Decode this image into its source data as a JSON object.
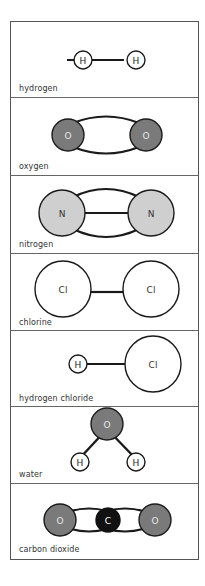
{
  "colors": {
    "border": "#555555",
    "bond": "#1a1a1a",
    "oxygen_fill": "#7a7a7a",
    "nitrogen_fill": "#cfcfcf",
    "carbon_fill": "#111111",
    "hydrogen_fill": "#ffffff",
    "chlorine_fill": "#ffffff",
    "label_text": "#333333"
  },
  "molecules": [
    {
      "name": "hydrogen",
      "atoms": [
        {
          "symbol": "H",
          "element": "hydrogen"
        },
        {
          "symbol": "H",
          "element": "hydrogen"
        }
      ],
      "bond": "single"
    },
    {
      "name": "oxygen",
      "atoms": [
        {
          "symbol": "O",
          "element": "oxygen"
        },
        {
          "symbol": "O",
          "element": "oxygen"
        }
      ],
      "bond": "double"
    },
    {
      "name": "nitrogen",
      "atoms": [
        {
          "symbol": "N",
          "element": "nitrogen"
        },
        {
          "symbol": "N",
          "element": "nitrogen"
        }
      ],
      "bond": "triple"
    },
    {
      "name": "chlorine",
      "atoms": [
        {
          "symbol": "Cl",
          "element": "chlorine"
        },
        {
          "symbol": "Cl",
          "element": "chlorine"
        }
      ],
      "bond": "single"
    },
    {
      "name": "hydrogen chloride",
      "atoms": [
        {
          "symbol": "H",
          "element": "hydrogen"
        },
        {
          "symbol": "Cl",
          "element": "chlorine"
        }
      ],
      "bond": "single"
    },
    {
      "name": "water",
      "atoms": [
        {
          "symbol": "O",
          "element": "oxygen"
        },
        {
          "symbol": "H",
          "element": "hydrogen"
        },
        {
          "symbol": "H",
          "element": "hydrogen"
        }
      ],
      "bond": "single"
    },
    {
      "name": "carbon dioxide",
      "atoms": [
        {
          "symbol": "O",
          "element": "oxygen"
        },
        {
          "symbol": "C",
          "element": "carbon"
        },
        {
          "symbol": "O",
          "element": "oxygen"
        }
      ],
      "bond": "double"
    }
  ]
}
